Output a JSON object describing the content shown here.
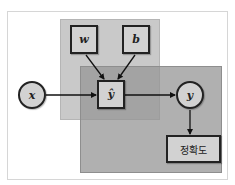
{
  "diagram": {
    "nodes": {
      "w": {
        "label": "w",
        "shape": "square"
      },
      "b": {
        "label": "b",
        "shape": "square"
      },
      "y_hat": {
        "label": "ŷ",
        "shape": "square"
      },
      "x": {
        "label": "x",
        "shape": "circle"
      },
      "y": {
        "label": "y",
        "shape": "circle"
      },
      "accuracy": {
        "label": "정확도",
        "shape": "rectangle"
      }
    },
    "edges": [
      {
        "from": "w",
        "to": "y_hat"
      },
      {
        "from": "b",
        "to": "y_hat"
      },
      {
        "from": "x",
        "to": "y_hat"
      },
      {
        "from": "y_hat",
        "to": "y"
      },
      {
        "from": "y",
        "to": "accuracy"
      }
    ],
    "groups": [
      {
        "name": "model-group",
        "members": [
          "w",
          "b",
          "y_hat"
        ],
        "color": "#c9c9c9"
      },
      {
        "name": "evaluation-group",
        "members": [
          "y_hat",
          "y",
          "accuracy"
        ],
        "color": "#969696"
      }
    ],
    "colors": {
      "node_fill": "#d2d2d2",
      "node_border": "#222222",
      "edge": "#111111"
    }
  }
}
